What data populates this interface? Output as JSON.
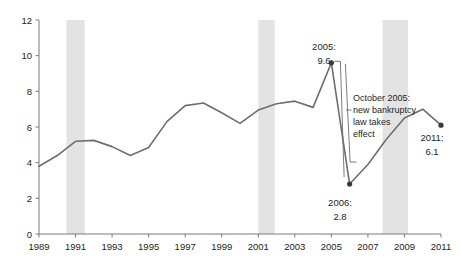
{
  "chart_data": {
    "type": "line",
    "title": "",
    "subtitle": "",
    "xlabel": "",
    "ylabel": "",
    "xlim": [
      1989,
      2011
    ],
    "ylim": [
      0,
      12
    ],
    "grid": false,
    "legend": "none",
    "x": [
      1989,
      1990,
      1991,
      1992,
      1993,
      1994,
      1995,
      1996,
      1997,
      1998,
      1999,
      2000,
      2001,
      2002,
      2003,
      2004,
      2005,
      2006,
      2007,
      2008,
      2009,
      2010,
      2011
    ],
    "values": [
      3.8,
      4.4,
      5.2,
      5.25,
      4.9,
      4.4,
      4.85,
      6.3,
      7.2,
      7.35,
      6.8,
      6.2,
      6.95,
      7.3,
      7.45,
      7.1,
      9.6,
      2.8,
      3.9,
      5.3,
      6.5,
      7.0,
      6.1
    ],
    "series": [
      {
        "name": "",
        "values": [
          3.8,
          4.4,
          5.2,
          5.25,
          4.9,
          4.4,
          4.85,
          6.3,
          7.2,
          7.35,
          6.8,
          6.2,
          6.95,
          7.3,
          7.45,
          7.1,
          9.6,
          2.8,
          3.9,
          5.3,
          6.5,
          7.0,
          6.1
        ]
      }
    ],
    "y_ticks": [
      0,
      2,
      4,
      6,
      8,
      10,
      12
    ],
    "y_tick_labels": [
      "0",
      "2",
      "4",
      "6",
      "8",
      "10",
      "12"
    ],
    "x_ticks": [
      1989,
      1991,
      1993,
      1995,
      1997,
      1999,
      2001,
      2003,
      2005,
      2007,
      2009,
      2011
    ],
    "x_tick_labels": [
      "1989",
      "1991",
      "1993",
      "1995",
      "1997",
      "1999",
      "2001",
      "2003",
      "2005",
      "2007",
      "2009",
      "2011"
    ],
    "shaded_bands": [
      {
        "name": "recession-band-1",
        "start": 1990.5,
        "end": 1991.5
      },
      {
        "name": "recession-band-2",
        "start": 2001.0,
        "end": 2001.9
      },
      {
        "name": "recession-band-3",
        "start": 2007.8,
        "end": 2009.2
      }
    ],
    "markers": [
      {
        "name": "peak-2005",
        "x": 2005,
        "y": 9.6
      },
      {
        "name": "trough-2006",
        "x": 2006,
        "y": 2.8
      },
      {
        "name": "end-2011",
        "x": 2011,
        "y": 6.1
      }
    ],
    "annotations": [
      {
        "name": "annotation-2005",
        "line1": "2005:",
        "line2": "9.6"
      },
      {
        "name": "annotation-2006",
        "line1": "2006:",
        "line2": "2.8"
      },
      {
        "name": "annotation-2011",
        "line1": "2011:",
        "line2": "6.1"
      },
      {
        "name": "annotation-bankruptcy-law",
        "line1": "October 2005:",
        "line2": "new bankruptcy",
        "line3": "law takes",
        "line4": "effect"
      }
    ],
    "colors": {
      "line": "#6e6e6e",
      "band": "#e3e3e3",
      "axis": "#7a7a7a",
      "text": "#231f20",
      "marker": "#3a3a3a",
      "leader": "#6e6e6e",
      "background": "#ffffff"
    }
  }
}
